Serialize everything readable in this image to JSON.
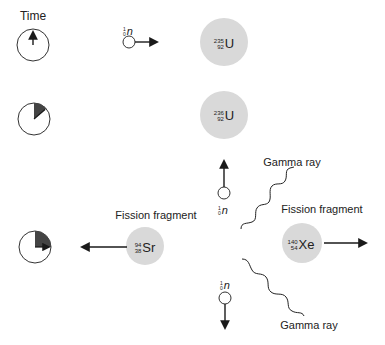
{
  "diagram": {
    "title_time": "Time",
    "clocks": [
      {
        "name": "clock-start",
        "cx": 33,
        "cy": 45,
        "r": 16,
        "fraction_deg": 0
      },
      {
        "name": "clock-mid",
        "cx": 34,
        "cy": 119,
        "r": 16,
        "fraction_deg": 50
      },
      {
        "name": "clock-end",
        "cx": 35,
        "cy": 247,
        "r": 16,
        "fraction_deg": 90
      }
    ],
    "incoming_neutron": {
      "mass": "1",
      "atomic": "0",
      "symbol": "n"
    },
    "nucleus_u235": {
      "mass": "235",
      "atomic": "92",
      "symbol": "U"
    },
    "nucleus_u236": {
      "mass": "236",
      "atomic": "92",
      "symbol": "U"
    },
    "fragment_sr": {
      "mass": "94",
      "atomic": "38",
      "symbol": "Sr",
      "label": "Fission fragment"
    },
    "fragment_xe": {
      "mass": "140",
      "atomic": "54",
      "symbol": "Xe",
      "label": "Fission fragment"
    },
    "neutron_up": {
      "mass": "1",
      "atomic": "0",
      "symbol": "n"
    },
    "neutron_down": {
      "mass": "1",
      "atomic": "0",
      "symbol": "n"
    },
    "gamma_upper": {
      "label": "Gamma ray"
    },
    "gamma_lower": {
      "label": "Gamma ray"
    },
    "colors": {
      "nucleus_fill": "#d9d9d9",
      "line": "#1a1a1a",
      "wedge": "#444444"
    }
  }
}
